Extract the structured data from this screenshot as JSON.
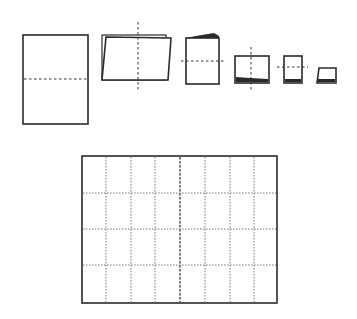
{
  "diagram": {
    "type": "paper-folding-sequence",
    "steps": [
      {
        "id": 1,
        "description": "flat sheet, horizontal fold line",
        "fold": "horizontal"
      },
      {
        "id": 2,
        "description": "folded in half, vertical fold line",
        "fold": "vertical"
      },
      {
        "id": 3,
        "description": "folded again, horizontal fold line",
        "fold": "horizontal"
      },
      {
        "id": 4,
        "description": "folded again, vertical fold line",
        "fold": "vertical"
      },
      {
        "id": 5,
        "description": "folded again, horizontal fold line",
        "fold": "horizontal"
      },
      {
        "id": 6,
        "description": "final folded booklet",
        "fold": "none"
      }
    ],
    "unfolded_grid": {
      "description": "unfolded sheet showing fold lines",
      "columns": 8,
      "rows": 4,
      "center_fold": "heavier vertical dashed line"
    }
  },
  "colors": {
    "stroke": "#2a2a2a",
    "background": "#ffffff"
  }
}
